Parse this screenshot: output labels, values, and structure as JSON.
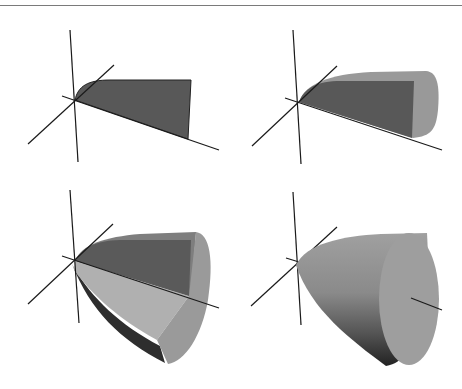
{
  "figure": {
    "panels": [
      {
        "stage": 1,
        "label": "Planar region"
      },
      {
        "stage": 2,
        "label": "Partial revolution"
      },
      {
        "stage": 3,
        "label": "Larger partial revolution"
      },
      {
        "stage": 4,
        "label": "Full solid of revolution"
      }
    ]
  },
  "colors": {
    "region": "#585858",
    "surface_light": "#a8a8a8",
    "surface_mid": "#8c8c8c",
    "surface_dark": "#3a3a3a",
    "end_cap": "#9c9c9c",
    "axis": "#1a1a1a",
    "rule": "#7a7a7a"
  }
}
